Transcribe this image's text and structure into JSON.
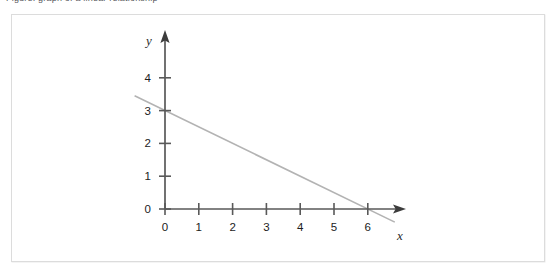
{
  "caption": {
    "text": "Figure: graph of a linear relationship",
    "visible_note": "clipped at top edge"
  },
  "figure": {
    "border_color": "#dcdcdc",
    "background": "#ffffff"
  },
  "axes": {
    "x_axis_label": "x",
    "y_axis_label": "y",
    "x_tick_labels": [
      "0",
      "1",
      "2",
      "3",
      "4",
      "5",
      "6"
    ],
    "y_tick_labels": [
      "0",
      "1",
      "2",
      "3",
      "4"
    ],
    "axis_color": "#595959",
    "tick_label_color": "#1c1c1c",
    "arrowheads": "both-axes"
  },
  "chart_data": {
    "type": "line",
    "title": "",
    "xlabel": "x",
    "ylabel": "y",
    "grid": false,
    "legend": "none",
    "xlim": [
      0,
      6.6
    ],
    "ylim": [
      0,
      4.6
    ],
    "xticks": [
      0,
      1,
      2,
      3,
      4,
      5,
      6
    ],
    "yticks": [
      0,
      1,
      2,
      3,
      4
    ],
    "series": [
      {
        "name": "line",
        "color": "#b3b3b3",
        "equation": "y = 3 - 0.5x",
        "slope": -0.5,
        "y_intercept": 3,
        "x_intercept": 6,
        "x": [
          -0.9,
          0,
          1,
          2,
          3,
          4,
          5,
          6,
          6.8
        ],
        "values": [
          3.45,
          3,
          2.5,
          2,
          1.5,
          1,
          0.5,
          0,
          -0.4
        ]
      }
    ]
  }
}
